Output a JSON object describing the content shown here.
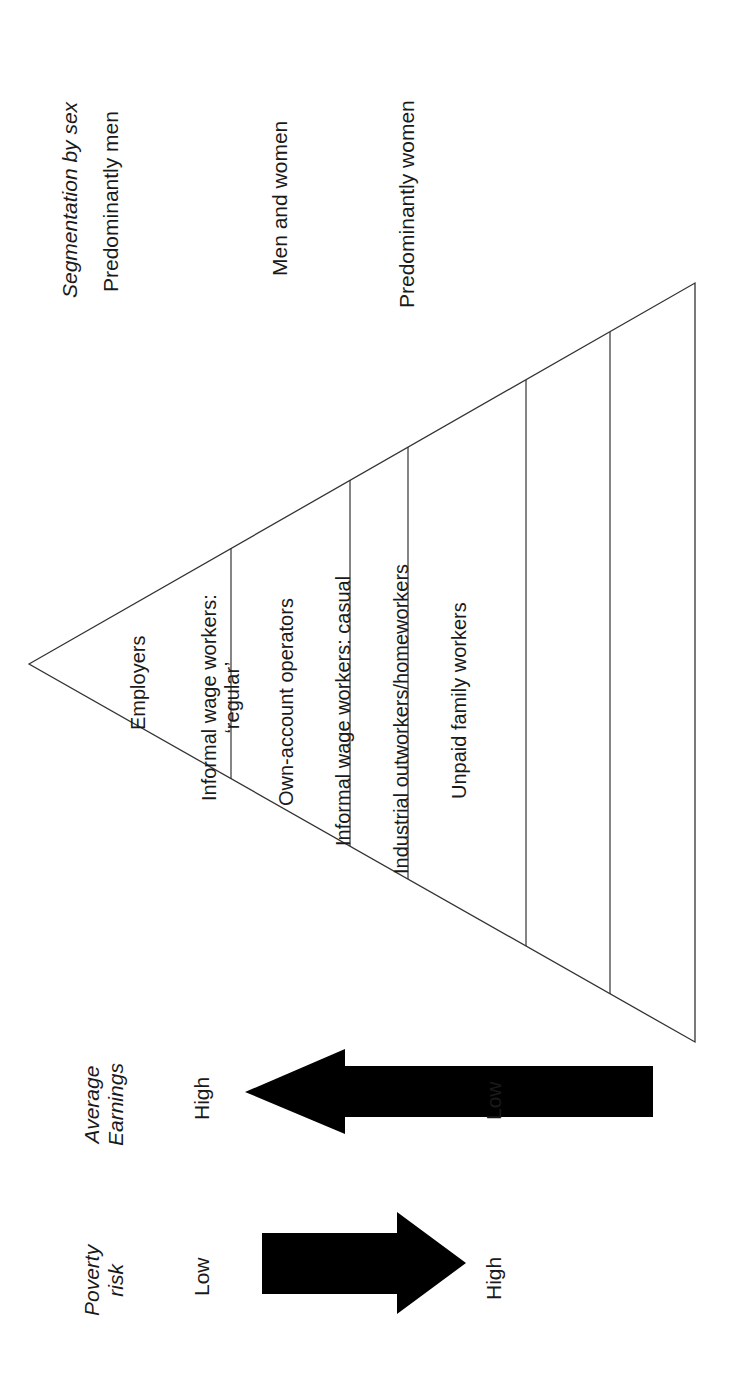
{
  "diagram": {
    "type": "pyramid",
    "orientation": "rotated-90-ccw",
    "segmentation_header": "Segmentation by sex",
    "sex_labels": [
      "Predominantly men",
      "Men and women",
      "Predominantly women"
    ],
    "tiers": [
      {
        "label_line1": "Employers",
        "label_line2": ""
      },
      {
        "label_line1": "Informal wage workers:",
        "label_line2": "‘regular’"
      },
      {
        "label_line1": "Own-account operators",
        "label_line2": ""
      },
      {
        "label_line1": "Informal wage workers: casual",
        "label_line2": ""
      },
      {
        "label_line1": "Industrial outworkers/homeworkers",
        "label_line2": ""
      },
      {
        "label_line1": "Unpaid family workers",
        "label_line2": ""
      }
    ],
    "poverty_risk": {
      "title_line1": "Poverty",
      "title_line2": "risk",
      "top": "Low",
      "bottom": "High"
    },
    "average_earnings": {
      "title_line1": "Average",
      "title_line2": "Earnings",
      "top": "High",
      "bottom": "Low"
    },
    "colors": {
      "line": "#333333",
      "arrow": "#000000",
      "background": "#ffffff"
    }
  }
}
